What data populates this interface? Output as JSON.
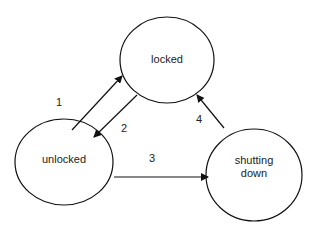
{
  "diagram": {
    "type": "state-machine",
    "states": [
      {
        "id": "locked",
        "label": "locked"
      },
      {
        "id": "unlocked",
        "label": "unlocked"
      },
      {
        "id": "shutting_down",
        "label_line1": "shutting",
        "label_line2": "down"
      }
    ],
    "transitions": [
      {
        "label": "1",
        "from": "unlocked",
        "to": "locked"
      },
      {
        "label": "2",
        "from": "locked",
        "to": "unlocked"
      },
      {
        "label": "3",
        "from": "unlocked",
        "to": "shutting_down"
      },
      {
        "label": "4",
        "from": "shutting_down",
        "to": "locked"
      }
    ],
    "colors": {
      "stroke": "#111111",
      "background": "#ffffff"
    }
  }
}
